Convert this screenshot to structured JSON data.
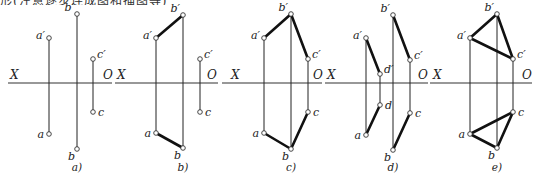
{
  "caption": "形(注意逐步连成图和描图等)",
  "axis_labels": {
    "x": "X",
    "o": "O"
  },
  "colors": {
    "line": "#222222",
    "thick_line": "#111111",
    "background": "#ffffff"
  },
  "panels": [
    {
      "id": "a",
      "caption": "a)",
      "axis": {
        "x1": 8,
        "x2": 112,
        "y": 83,
        "x_label_x": 10,
        "o_label_x": 103
      },
      "points": {
        "a_prime": {
          "label": "a′",
          "x": 49,
          "y": 38
        },
        "b_prime": {
          "label": "b′",
          "x": 77,
          "y": 14
        },
        "c_prime": {
          "label": "c′",
          "x": 93,
          "y": 59
        },
        "a": {
          "label": "a",
          "x": 49,
          "y": 134
        },
        "b": {
          "label": "b",
          "x": 77,
          "y": 149
        },
        "c": {
          "label": "c",
          "x": 93,
          "y": 112
        }
      },
      "projection_lines": [
        [
          "a_prime",
          "a"
        ],
        [
          "b_prime",
          "b"
        ],
        [
          "c_prime",
          "c"
        ]
      ],
      "thick_lines": []
    },
    {
      "id": "b",
      "caption": "b)",
      "axis": {
        "x1": 115,
        "x2": 218,
        "y": 83,
        "x_label_x": 117,
        "o_label_x": 207
      },
      "points": {
        "a_prime": {
          "label": "a′",
          "x": 156,
          "y": 38
        },
        "b_prime": {
          "label": "b′",
          "x": 183,
          "y": 15
        },
        "c_prime": {
          "label": "c′",
          "x": 200,
          "y": 59
        },
        "a": {
          "label": "a",
          "x": 156,
          "y": 133
        },
        "b": {
          "label": "b",
          "x": 183,
          "y": 148
        },
        "c": {
          "label": "c",
          "x": 200,
          "y": 112
        }
      },
      "projection_lines": [
        [
          "a_prime",
          "a"
        ],
        [
          "b_prime",
          "b"
        ],
        [
          "c_prime",
          "c"
        ]
      ],
      "thick_lines": [
        [
          "a_prime",
          "b_prime"
        ],
        [
          "a",
          "b"
        ]
      ]
    },
    {
      "id": "c",
      "caption": "c)",
      "axis": {
        "x1": 222,
        "x2": 322,
        "y": 83,
        "x_label_x": 231,
        "o_label_x": 313
      },
      "points": {
        "a_prime": {
          "label": "a′",
          "x": 264,
          "y": 38
        },
        "b_prime": {
          "label": "b′",
          "x": 291,
          "y": 14
        },
        "c_prime": {
          "label": "c′",
          "x": 308,
          "y": 59
        },
        "a": {
          "label": "a",
          "x": 264,
          "y": 133
        },
        "b": {
          "label": "b",
          "x": 291,
          "y": 149
        },
        "c": {
          "label": "c",
          "x": 308,
          "y": 112
        }
      },
      "projection_lines": [
        [
          "a_prime",
          "a"
        ],
        [
          "b_prime",
          "b"
        ],
        [
          "c_prime",
          "c"
        ]
      ],
      "thick_lines": [
        [
          "a_prime",
          "b_prime"
        ],
        [
          "b_prime",
          "c_prime"
        ],
        [
          "a",
          "b"
        ],
        [
          "b",
          "c"
        ]
      ]
    },
    {
      "id": "d",
      "caption": "d)",
      "axis": {
        "x1": 325,
        "x2": 428,
        "y": 83,
        "x_label_x": 327,
        "o_label_x": 418
      },
      "points": {
        "a_prime": {
          "label": "a′",
          "x": 366,
          "y": 38
        },
        "d_prime": {
          "label": "d′",
          "x": 380,
          "y": 74
        },
        "b_prime": {
          "label": "b′",
          "x": 393,
          "y": 15
        },
        "c_prime": {
          "label": "c′",
          "x": 410,
          "y": 60
        },
        "a": {
          "label": "a",
          "x": 366,
          "y": 135
        },
        "d": {
          "label": "d",
          "x": 380,
          "y": 105
        },
        "b": {
          "label": "b",
          "x": 393,
          "y": 150
        },
        "c": {
          "label": "c",
          "x": 410,
          "y": 113
        }
      },
      "projection_lines": [
        [
          "a_prime",
          "a"
        ],
        [
          "d_prime",
          "d"
        ],
        [
          "b_prime",
          "b"
        ],
        [
          "c_prime",
          "c"
        ]
      ],
      "thick_lines": [
        [
          "a_prime",
          "d_prime"
        ],
        [
          "a",
          "d"
        ],
        [
          "b_prime",
          "c_prime"
        ],
        [
          "b",
          "c"
        ]
      ]
    },
    {
      "id": "e",
      "caption": "e)",
      "axis": {
        "x1": 430,
        "x2": 532,
        "y": 83,
        "x_label_x": 433,
        "o_label_x": 522
      },
      "points": {
        "a_prime": {
          "label": "a′",
          "x": 470,
          "y": 38
        },
        "b_prime": {
          "label": "b′",
          "x": 497,
          "y": 14
        },
        "c_prime": {
          "label": "c′",
          "x": 513,
          "y": 59
        },
        "a": {
          "label": "a",
          "x": 470,
          "y": 134
        },
        "b": {
          "label": "b",
          "x": 497,
          "y": 148
        },
        "c": {
          "label": "c",
          "x": 513,
          "y": 112
        }
      },
      "projection_lines": [
        [
          "a_prime",
          "a"
        ],
        [
          "b_prime",
          "b"
        ],
        [
          "c_prime",
          "c"
        ]
      ],
      "thick_lines": [
        [
          "a_prime",
          "b_prime"
        ],
        [
          "b_prime",
          "c_prime"
        ],
        [
          "a_prime",
          "c_prime"
        ],
        [
          "a",
          "b"
        ],
        [
          "b",
          "c"
        ],
        [
          "a",
          "c"
        ]
      ]
    }
  ]
}
